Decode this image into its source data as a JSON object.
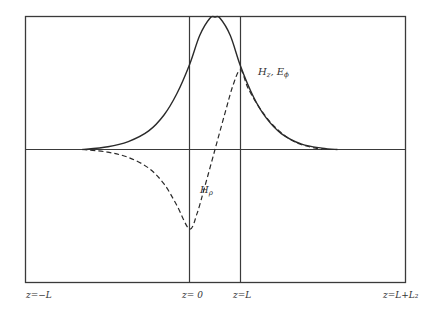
{
  "chart_data": {
    "type": "line",
    "title": "",
    "xlabel": "z",
    "ylabel": "",
    "x_tick_labels": [
      {
        "x": -1.0,
        "label": "z=−L"
      },
      {
        "x": 0.0,
        "label": "z= 0"
      },
      {
        "x": 1.0,
        "label": "z=L"
      },
      {
        "x": 3.0,
        "label": "z=L+L₂"
      }
    ],
    "vertical_markers": [
      0.0,
      1.0
    ],
    "baseline": 0.0,
    "xlim": [
      -3.1,
      4.2
    ],
    "ylim": [
      -1.3,
      1.0
    ],
    "grid": false,
    "series": [
      {
        "name": "H_z, E_phi",
        "label_main": "H",
        "label_sub": "z",
        "label_extra": ", E",
        "label_extra_sub": "ϕ",
        "style": "solid",
        "x": [
          -2.1,
          -1.6,
          -1.2,
          -0.8,
          -0.5,
          -0.25,
          0.0,
          0.2,
          0.4,
          0.5,
          0.6,
          0.8,
          1.0,
          1.25,
          1.5,
          1.8,
          2.2,
          2.6,
          2.9
        ],
        "y": [
          0.0,
          0.02,
          0.06,
          0.14,
          0.26,
          0.42,
          0.64,
          0.86,
          0.99,
          1.0,
          0.99,
          0.86,
          0.63,
          0.4,
          0.24,
          0.12,
          0.04,
          0.01,
          0.0
        ]
      },
      {
        "name": "H_rho",
        "label_main": "H",
        "label_sub": "ρ",
        "style": "dashed",
        "x": [
          -2.1,
          -1.6,
          -1.2,
          -0.8,
          -0.5,
          -0.25,
          0.0,
          0.15,
          0.3,
          0.5,
          0.7,
          0.85,
          1.0,
          1.15,
          1.4,
          1.7,
          2.1,
          2.6
        ],
        "y": [
          0.0,
          -0.02,
          -0.06,
          -0.14,
          -0.26,
          -0.42,
          -0.6,
          -0.48,
          -0.28,
          0.0,
          0.28,
          0.48,
          0.6,
          0.46,
          0.3,
          0.16,
          0.05,
          0.0
        ]
      }
    ]
  }
}
